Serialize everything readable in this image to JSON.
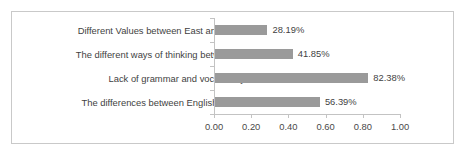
{
  "chart_data": {
    "type": "bar",
    "orientation": "horizontal",
    "title": "",
    "xlabel": "",
    "ylabel": "",
    "xlim": [
      0,
      1
    ],
    "grid": false,
    "legend": null,
    "bar_color": "#9a9a9a",
    "axis_color": "#c3c3c3",
    "text_color": "#3f3f3f",
    "frame_color": "#c9c9c9",
    "categories": [
      "Different Values between East and West",
      "The different ways of thinking between…",
      "Lack of grammar and vocabulary",
      "The differences between English and…"
    ],
    "values": [
      0.2819,
      0.4185,
      0.8238,
      0.5639
    ],
    "value_labels": [
      "28.19%",
      "41.85%",
      "82.38%",
      "56.39%"
    ],
    "xticks": [
      0,
      0.2,
      0.4,
      0.6,
      0.8,
      1.0
    ],
    "xtick_labels": [
      "0.00",
      "0.20",
      "0.40",
      "0.60",
      "0.80",
      "1.00"
    ]
  }
}
